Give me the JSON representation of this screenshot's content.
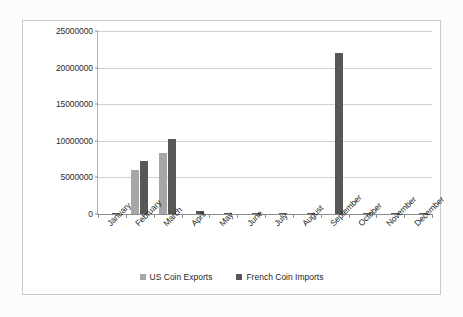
{
  "chart_data": {
    "type": "bar",
    "title": "",
    "xlabel": "",
    "ylabel": "",
    "ylim": [
      0,
      25000000
    ],
    "grid": true,
    "legend_position": "bottom",
    "categories": [
      "January",
      "February",
      "March",
      "April",
      "May",
      "June",
      "July",
      "August",
      "September",
      "October",
      "November",
      "December"
    ],
    "ytick_labels": [
      "0",
      "5000000",
      "10000000",
      "15000000",
      "20000000",
      "25000000"
    ],
    "ytick_values": [
      0,
      5000000,
      10000000,
      15000000,
      20000000,
      25000000
    ],
    "series": [
      {
        "name": "US Coin Exports",
        "color": "#a6a6a6",
        "values": [
          0,
          6000000,
          8300000,
          0,
          0,
          0,
          0,
          0,
          0,
          0,
          0,
          0
        ]
      },
      {
        "name": "French Coin Imports",
        "color": "#575757",
        "values": [
          200000,
          7200000,
          10200000,
          450000,
          150000,
          150000,
          200000,
          100000,
          22000000,
          150000,
          80000,
          150000
        ]
      }
    ]
  },
  "legend": {
    "items": [
      {
        "label": "US Coin Exports",
        "swatch": "us"
      },
      {
        "label": "French Coin Imports",
        "swatch": "fr"
      }
    ]
  }
}
